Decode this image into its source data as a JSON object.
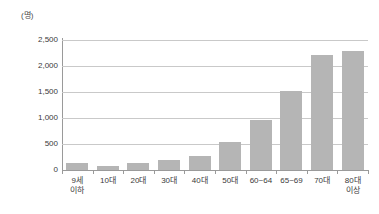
{
  "chart_data": {
    "type": "bar",
    "title": "",
    "subtitle": "",
    "unit_label": "(명)",
    "xlabel": "",
    "ylabel": "",
    "ylim": [
      0,
      2500
    ],
    "ytick_labels": [
      "2,500",
      "2,000",
      "1,500",
      "1,000",
      "500",
      "0"
    ],
    "ytick_values": [
      2500,
      2000,
      1500,
      1000,
      500,
      0
    ],
    "grid": true,
    "legend": null,
    "legend_position": "none",
    "categories": [
      "9세\n이하",
      "10대",
      "20대",
      "30대",
      "40대",
      "50대",
      "60~64",
      "65~69",
      "70대",
      "80대\n이상"
    ],
    "values": [
      140,
      80,
      130,
      200,
      260,
      540,
      970,
      1520,
      2210,
      2280
    ],
    "series": [
      {
        "name": "",
        "values": [
          140,
          80,
          130,
          200,
          260,
          540,
          970,
          1520,
          2210,
          2280
        ]
      }
    ],
    "colors": {
      "bar": "#b5b5b5",
      "gridline": "#c9c9c9",
      "axis": "#9a9a9a",
      "text": "#3a3a3a",
      "background": "#ffffff"
    }
  }
}
